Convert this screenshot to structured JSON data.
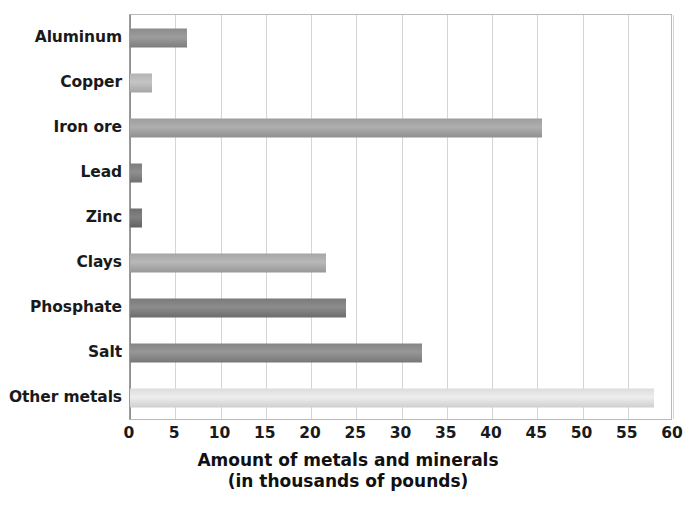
{
  "chart_data": {
    "type": "bar",
    "orientation": "horizontal",
    "title": "",
    "xlabel": "Amount of metals and minerals",
    "xlabel_line2": "(in thousands of pounds)",
    "ylabel": "",
    "xlim": [
      0,
      60
    ],
    "xticks": [
      0,
      5,
      10,
      15,
      20,
      25,
      30,
      35,
      40,
      45,
      50,
      55,
      60
    ],
    "grid": true,
    "legend": false,
    "categories": [
      "Aluminum",
      "Copper",
      "Iron ore",
      "Lead",
      "Zinc",
      "Clays",
      "Phosphate",
      "Salt",
      "Other metals"
    ],
    "values": [
      6.3,
      2.4,
      45.5,
      1.3,
      1.3,
      21.7,
      23.9,
      32.3,
      57.9
    ],
    "bar_colors": [
      "#8b8b8b",
      "#b3b3b3",
      "#9d9d9d",
      "#7d7d7d",
      "#6f6f6f",
      "#a6a6a6",
      "#7a7a7a",
      "#858585",
      "#dcdcdc"
    ]
  },
  "style": {
    "plot_background": "#ffffff",
    "grid_color": "#d5d5d5",
    "axis_color": "#8f8f8f",
    "text_color": "#1a1a1a"
  }
}
